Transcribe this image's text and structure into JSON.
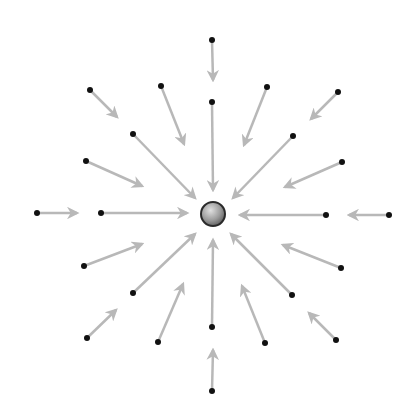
{
  "diagram": {
    "width": 414,
    "height": 417,
    "colors": {
      "background": "#ffffff",
      "arrow": "#b8b8b8",
      "dot": "#111111",
      "charge_fill_light": "#d8d8d8",
      "charge_fill_dark": "#6e6e6e",
      "charge_stroke": "#2a2a2a"
    },
    "charge": {
      "cx": 213,
      "cy": 214,
      "r": 12,
      "label": ""
    },
    "arrows": [
      {
        "from": [
          212,
          40
        ],
        "to": [
          213,
          80
        ]
      },
      {
        "from": [
          212,
          102
        ],
        "to": [
          213,
          190
        ]
      },
      {
        "from": [
          37,
          213
        ],
        "to": [
          77,
          213
        ]
      },
      {
        "from": [
          101,
          213
        ],
        "to": [
          187,
          213
        ]
      },
      {
        "from": [
          326,
          215
        ],
        "to": [
          240,
          215
        ]
      },
      {
        "from": [
          389,
          215
        ],
        "to": [
          349,
          215
        ]
      },
      {
        "from": [
          212,
          327
        ],
        "to": [
          213,
          240
        ]
      },
      {
        "from": [
          212,
          391
        ],
        "to": [
          213,
          350
        ]
      },
      {
        "from": [
          90,
          90
        ],
        "to": [
          117,
          117
        ]
      },
      {
        "from": [
          161,
          86
        ],
        "to": [
          184,
          144
        ]
      },
      {
        "from": [
          133,
          134
        ],
        "to": [
          195,
          198
        ]
      },
      {
        "from": [
          86,
          161
        ],
        "to": [
          142,
          186
        ]
      },
      {
        "from": [
          267,
          87
        ],
        "to": [
          244,
          145
        ]
      },
      {
        "from": [
          338,
          92
        ],
        "to": [
          311,
          119
        ]
      },
      {
        "from": [
          293,
          136
        ],
        "to": [
          233,
          198
        ]
      },
      {
        "from": [
          342,
          162
        ],
        "to": [
          285,
          187
        ]
      },
      {
        "from": [
          341,
          268
        ],
        "to": [
          283,
          245
        ]
      },
      {
        "from": [
          292,
          295
        ],
        "to": [
          231,
          234
        ]
      },
      {
        "from": [
          265,
          343
        ],
        "to": [
          242,
          286
        ]
      },
      {
        "from": [
          336,
          340
        ],
        "to": [
          309,
          313
        ]
      },
      {
        "from": [
          84,
          266
        ],
        "to": [
          142,
          244
        ]
      },
      {
        "from": [
          133,
          293
        ],
        "to": [
          195,
          234
        ]
      },
      {
        "from": [
          87,
          338
        ],
        "to": [
          116,
          310
        ]
      },
      {
        "from": [
          158,
          342
        ],
        "to": [
          183,
          284
        ]
      }
    ]
  }
}
